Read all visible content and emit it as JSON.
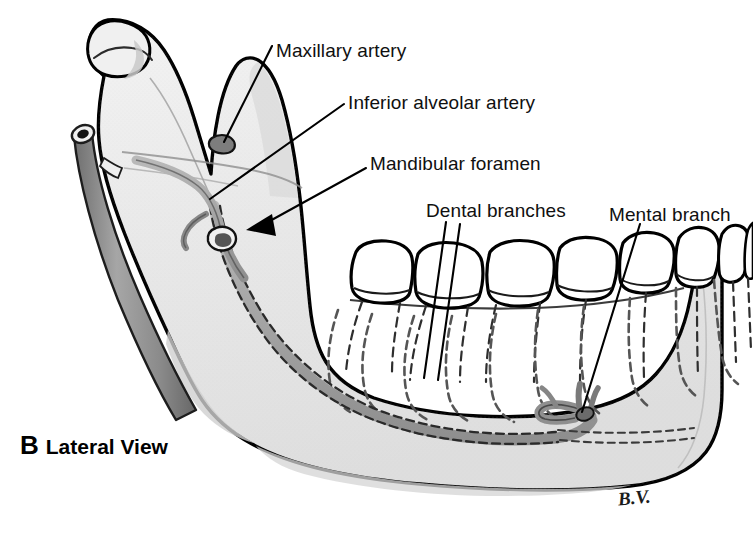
{
  "figure": {
    "title": "Lateral View",
    "panel_letter": "B",
    "signature": "B.V.",
    "view": "Lateral View"
  },
  "labels": [
    {
      "id": "maxillary-artery",
      "text": "Maxillary artery"
    },
    {
      "id": "inferior-alveolar-artery",
      "text": "Inferior alveolar artery"
    },
    {
      "id": "mandibular-foramen",
      "text": "Mandibular foramen"
    },
    {
      "id": "dental-branches",
      "text": "Dental branches"
    },
    {
      "id": "mental-branch",
      "text": "Mental branch"
    }
  ],
  "colors": {
    "background": "#ffffff",
    "bone_fill": "#ebebeb",
    "bone_shade": "#d8d8d8",
    "bone_outline": "#000000",
    "vessel_fill": "#9a9a9a",
    "vessel_dark": "#6e6e6e",
    "tooth_fill": "#ffffff",
    "label_text": "#101010",
    "leader_line": "#000000"
  }
}
